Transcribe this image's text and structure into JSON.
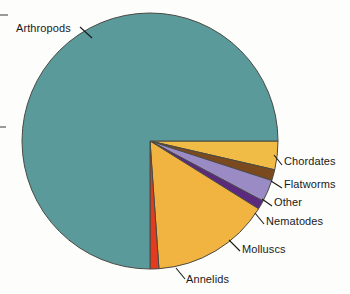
{
  "figure": {
    "background_color": "#fdfdfb",
    "label_color": "#1a1a1a",
    "leader_line_color": "#1a1a1a",
    "slice_outline_color": "#4a4a44"
  },
  "chart_data": {
    "type": "pie",
    "title": "",
    "subtitle": "",
    "xlabel": "",
    "ylabel": "",
    "grid": false,
    "legend": "callout-labels",
    "legend_position": "outside-callouts",
    "center": {
      "x": 150,
      "y": 141
    },
    "radius": 128,
    "start_angle_deg": 0,
    "direction": "clockwise",
    "categories": [
      "Chordates",
      "Flatworms",
      "Other",
      "Nematodes",
      "Molluscs",
      "Annelids",
      "Arthropods"
    ],
    "values": [
      3.6,
      1.4,
      2.8,
      1.1,
      15.0,
      1.1,
      75.0
    ],
    "units": "percent of described animal species",
    "slices": [
      {
        "label": "Chordates",
        "value": 3.6,
        "color": "#f0bc46",
        "start_angle_deg": 0,
        "end_angle_deg": 13,
        "label_x": 285,
        "label_y": 161,
        "leader": {
          "x1": 274,
          "y1": 155,
          "x2": 282,
          "y2": 165
        }
      },
      {
        "label": "Flatworms",
        "value": 1.4,
        "color": "#7a4a1e",
        "start_angle_deg": 13,
        "end_angle_deg": 18,
        "label_x": 285,
        "label_y": 184,
        "leader": {
          "x1": 271,
          "y1": 181,
          "x2": 282,
          "y2": 188
        }
      },
      {
        "label": "Other",
        "value": 2.8,
        "color": "#9b8bc4",
        "start_angle_deg": 18,
        "end_angle_deg": 28,
        "label_x": 275,
        "label_y": 203,
        "leader": {
          "x1": 262,
          "y1": 199,
          "x2": 272,
          "y2": 206
        }
      },
      {
        "label": "Nematodes",
        "value": 1.1,
        "color": "#5b2a7e",
        "start_angle_deg": 28,
        "end_angle_deg": 32,
        "label_x": 267,
        "label_y": 222,
        "leader": {
          "x1": 255,
          "y1": 213,
          "x2": 264,
          "y2": 224
        }
      },
      {
        "label": "Molluscs",
        "value": 15.0,
        "color": "#f2b441",
        "start_angle_deg": 32,
        "end_angle_deg": 86,
        "label_x": 243,
        "label_y": 250,
        "leader": {
          "x1": 229,
          "y1": 240,
          "x2": 240,
          "y2": 251
        }
      },
      {
        "label": "Annelids",
        "value": 1.1,
        "color": "#e23b20",
        "start_angle_deg": 86,
        "end_angle_deg": 90,
        "label_x": 187,
        "label_y": 281,
        "leader": {
          "x1": 176,
          "y1": 268,
          "x2": 185,
          "y2": 279
        }
      },
      {
        "label": "Arthropods",
        "value": 75.0,
        "color": "#5a9a9b",
        "start_angle_deg": 90,
        "end_angle_deg": 360,
        "label_x": 16,
        "label_y": 29,
        "leader": {
          "x1": 80,
          "y1": 27,
          "x2": 92,
          "y2": 38
        }
      }
    ]
  },
  "labels": {
    "arthropods": "Arthropods",
    "chordates": "Chordates",
    "flatworms": "Flatworms",
    "other": "Other",
    "nematodes": "Nematodes",
    "molluscs": "Molluscs",
    "annelids": "Annelids"
  }
}
